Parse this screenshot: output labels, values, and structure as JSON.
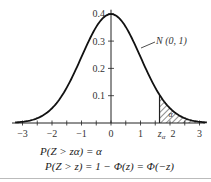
{
  "chart_data": {
    "type": "line",
    "title": "",
    "curve_label": "N (0, 1)",
    "xlabel": "",
    "ylabel": "",
    "x_ticks": [
      "-3",
      "-2",
      "-1",
      "0",
      "1",
      "2",
      "3"
    ],
    "x_special_tick": "z_α",
    "y_ticks": [
      "0.1",
      "0.2",
      "0.3",
      "0.4"
    ],
    "xlim": [
      -3.2,
      3.2
    ],
    "ylim": [
      0,
      0.42
    ],
    "series": [
      {
        "name": "Standard normal density N(0,1)",
        "x": [
          -3,
          -2.5,
          -2,
          -1.5,
          -1,
          -0.5,
          0,
          0.5,
          1,
          1.5,
          2,
          2.5,
          3
        ],
        "values": [
          0.004,
          0.018,
          0.054,
          0.13,
          0.242,
          0.352,
          0.399,
          0.352,
          0.242,
          0.13,
          0.054,
          0.018,
          0.004
        ]
      }
    ],
    "shaded_region": {
      "from": "z_α",
      "from_value": 1.645,
      "to": 3,
      "label": "α",
      "pattern": "hatched"
    },
    "grid": false
  },
  "labels": {
    "curve": "N (0, 1)",
    "alpha": "α",
    "z_alpha_main": "z",
    "z_alpha_sub": "α",
    "x_ticks": [
      "−3",
      "−2",
      "−1",
      "0",
      "1",
      "2",
      "3"
    ],
    "y_ticks": [
      "0.1",
      "0.2",
      "0.3",
      "0.4"
    ]
  },
  "formulas": {
    "line1": "P(Z > zα) = α",
    "line2": "P(Z > z) = 1 − Φ(z) = Φ(−z)"
  }
}
